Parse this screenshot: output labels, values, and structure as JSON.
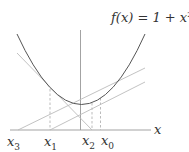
{
  "diagram": {
    "title_func": "f(x) = 1 + x",
    "title_exp": "2",
    "axis_label": "x",
    "points": [
      {
        "name": "x",
        "sub": "3"
      },
      {
        "name": "x",
        "sub": "1"
      },
      {
        "name": "x",
        "sub": "2"
      },
      {
        "name": "x",
        "sub": "0"
      }
    ]
  }
}
